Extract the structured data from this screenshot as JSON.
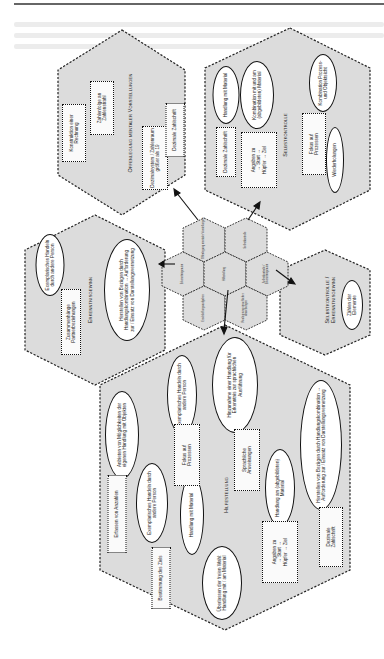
{
  "page": {
    "background": "#ffffff",
    "hex_fill": "#dcdcdc",
    "hex_stroke": "#222222"
  },
  "center_cluster": {
    "cells": [
      {
        "label": "Offenlegung mentaler Vorstellungen"
      },
      {
        "label": "Selbstkontrolle"
      },
      {
        "label": "Erkenntnisgewinn"
      },
      {
        "label": "Hilfestellung"
      },
      {
        "label": "Selbstkontrolle / Erkenntnisgewinn"
      },
      {
        "label": "Erschließungsaufgaben"
      },
      {
        "label": "Realisierung sprachlicher Anweisungen"
      }
    ]
  },
  "offenlegung": {
    "title": "Offenlegung mentaler Vorstellungen",
    "boxes": [
      {
        "text": "Konstruktion einer Rechnung"
      },
      {
        "text": "Zahlenfolge an Zahlenstrahl"
      },
      {
        "text": "Dezimalsystem / Zahlenraum größer als 19"
      },
      {
        "text": "Dezimale Zahlschrift"
      }
    ]
  },
  "selbstkontrolle": {
    "title": "Selbstkontrolle",
    "ovals": [
      {
        "text": "Handlung mit Material"
      },
      {
        "text": "Kombination mit und am (abgebildeten) Material"
      },
      {
        "text": "Kombination Prozess- und Objektsicht"
      },
      {
        "text": "Wiederholungen"
      }
    ],
    "boxes": [
      {
        "text": "Dezimale Zahlschrift"
      },
      {
        "text": "Angaben zu → Start → Hüpfer → Ziel"
      },
      {
        "text": "Fokus auf Prozessen"
      }
    ]
  },
  "erkenntnisgewinn": {
    "title": "Erkenntnisgewinn",
    "ovals": [
      {
        "text": "Exemplarisches Handeln durch andere Person"
      },
      {
        "text": "Herstellen von Bezügen durch Handlungskombination → Aufforderung zur / Einsatz von Darstellungsvernetzung"
      }
    ],
    "boxes": [
      {
        "text": "Zusammenhänge Partnerbeziehungen"
      }
    ]
  },
  "selbstkontrolle_erkenntnisgewinn": {
    "title": "Selbstkontrolle / Erkenntnisgewinn",
    "ovals": [
      {
        "text": "Zählen der Elemente"
      }
    ]
  },
  "hilfestellung": {
    "title": "Hilfestellung",
    "ovals": [
      {
        "text": "Anbieten von Möglichkeiten der eigenen Handlung mit Objekten"
      },
      {
        "text": "Exemplarisches Handeln durch andere Person"
      },
      {
        "text": "Exemplarisches Handeln durch andere Person"
      },
      {
        "text": "Handlung mit Material"
      },
      {
        "text": "Hinzunahme einer Handlung für Erkenntnis zur sprachlichen Ausführung"
      },
      {
        "text": "Handlung am (abgebildeten) Material"
      },
      {
        "text": "Herstellen von Bezügen durch Handlungskombination → Aufforderung zur / Einsatz von Darstellungsvernetzung"
      },
      {
        "text": "Überlassen der freien Wahl: Handlung mit / am Material"
      }
    ],
    "boxes": [
      {
        "text": "Erfassen von Anzahlen"
      },
      {
        "text": "Bestimmung des Ziels"
      },
      {
        "text": "Fokus auf Prozessen"
      },
      {
        "text": "Sprachliche Anweisungen"
      },
      {
        "text": "Angaben zu → Start → Hüpfer → Ziel"
      },
      {
        "text": "Dezimale Zahlschrift"
      }
    ]
  }
}
